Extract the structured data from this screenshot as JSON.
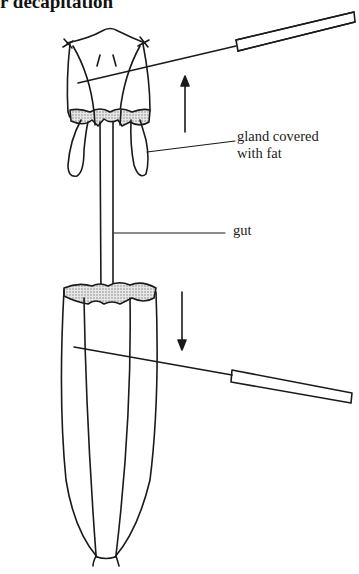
{
  "title": "r decapitation",
  "labels": {
    "gland_line1": "gland covered",
    "gland_line2": "with fat",
    "gut": "gut"
  },
  "arrows": {
    "upper": "up",
    "lower": "down"
  },
  "colors": {
    "ink": "#1a1a1a",
    "stipple": "#bdbdbd",
    "background": "#ffffff"
  }
}
